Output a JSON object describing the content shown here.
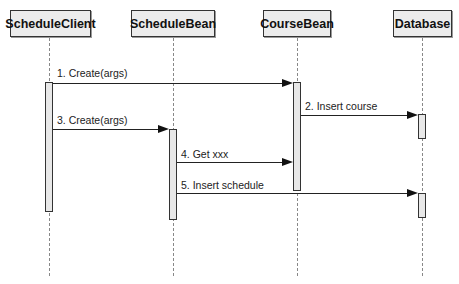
{
  "diagram": {
    "type": "sequence",
    "participants": [
      {
        "id": "client",
        "label": "ScheduleClient"
      },
      {
        "id": "schedulebean",
        "label": "ScheduleBean"
      },
      {
        "id": "coursebean",
        "label": "CourseBean"
      },
      {
        "id": "database",
        "label": "Database"
      }
    ],
    "messages": [
      {
        "from": "client",
        "to": "coursebean",
        "label": "1. Create(args)"
      },
      {
        "from": "coursebean",
        "to": "database",
        "label": "2. Insert course"
      },
      {
        "from": "client",
        "to": "schedulebean",
        "label": "3. Create(args)"
      },
      {
        "from": "schedulebean",
        "to": "coursebean",
        "label": "4. Get xxx"
      },
      {
        "from": "schedulebean",
        "to": "database",
        "label": "5. Insert schedule"
      }
    ]
  }
}
